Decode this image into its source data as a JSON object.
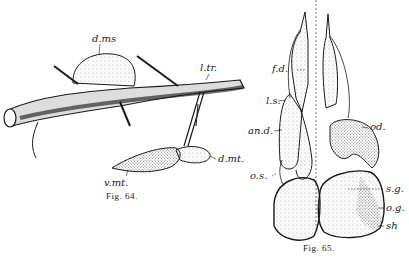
{
  "figures": [
    {
      "caption": "Fig. 64.",
      "labels": {
        "dms": "d.ms",
        "ltr": "l.tr.",
        "dmt": "d.mt.",
        "vmt": "v.mt."
      }
    },
    {
      "caption": "Fig. 65.",
      "labels": {
        "fd": "f.d.",
        "ls": "l.s.",
        "and": "an.d.",
        "os": "o.s.",
        "od": "od.",
        "sg": "s.g.",
        "og": "o.g.",
        "sh": "sh"
      }
    }
  ],
  "colors": {
    "ink": "#1a1a1a",
    "stipple": "#9a9a9a",
    "background": "#ffffff"
  }
}
